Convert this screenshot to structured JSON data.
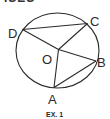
{
  "header": {
    "text": "ISES"
  },
  "diagram": {
    "caption": "EX. 1",
    "center_label": "O",
    "points": [
      {
        "label": "A",
        "x": 54,
        "y": 87.5
      },
      {
        "label": "B",
        "x": 96,
        "y": 61
      },
      {
        "label": "C",
        "x": 87.5,
        "y": 23.5
      },
      {
        "label": "D",
        "x": 22.5,
        "y": 29.5
      }
    ],
    "center": {
      "x": 58.5,
      "y": 49.5
    },
    "segments": [
      "DC",
      "DO",
      "OC",
      "OB",
      "OA",
      "AB"
    ],
    "stroke_color": "#2a2a2a"
  }
}
